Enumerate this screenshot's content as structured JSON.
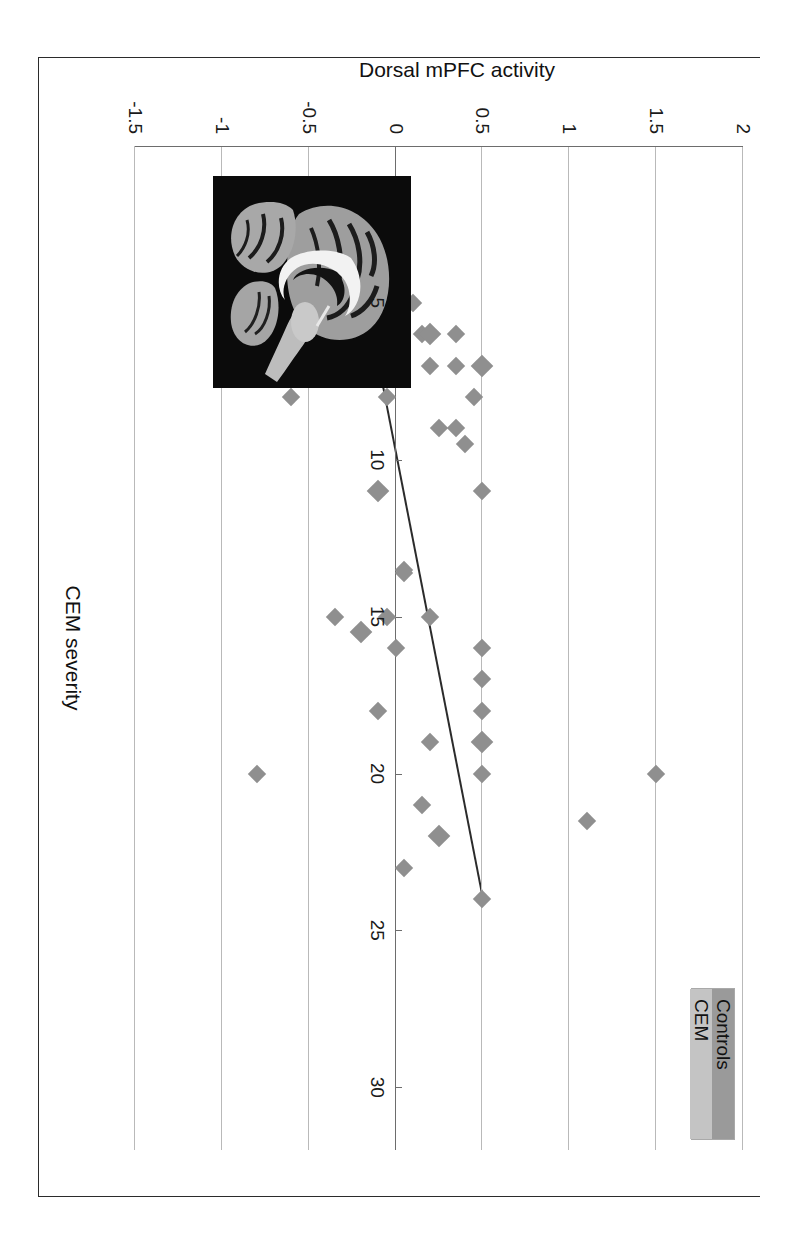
{
  "figure": {
    "legend": {
      "items": [
        {
          "label": "Controls",
          "color": "#9a9a9a"
        },
        {
          "label": "CEM",
          "color": "#c4c4c4"
        }
      ]
    },
    "inset": {
      "name": "sagittal-brain-mri",
      "description": "Sagittal MRI brain slice showing dorsal mPFC region"
    },
    "orientation_note": "Chart printed rotated 90 degrees clockwise on the page"
  },
  "chart_data": {
    "type": "scatter",
    "title": "",
    "xlabel": "CEM severity",
    "ylabel": "Dorsal mPFC activity",
    "xlim": [
      0,
      32
    ],
    "ylim": [
      -1.5,
      2
    ],
    "xticks": [
      5,
      10,
      15,
      20,
      25,
      30
    ],
    "yticks": [
      -1.5,
      -1,
      -0.5,
      0,
      0.5,
      1,
      1.5,
      2
    ],
    "grid": true,
    "legend_position": "top-right",
    "marker": "diamond",
    "marker_color": "#8f8f8f",
    "trendline": {
      "name": "linear-fit",
      "color": "#2b2b2b",
      "x_start": 4.6,
      "y_start": -0.18,
      "x_end": 23.9,
      "y_end": 0.5
    },
    "points": [
      {
        "x": 5,
        "y": -0.9
      },
      {
        "x": 5,
        "y": -0.35
      },
      {
        "x": 5,
        "y": -0.3
      },
      {
        "x": 5,
        "y": -0.05
      },
      {
        "x": 5,
        "y": 0.1
      },
      {
        "x": 6,
        "y": -0.05
      },
      {
        "x": 6,
        "y": 0.15
      },
      {
        "x": 6,
        "y": 0.2
      },
      {
        "x": 6,
        "y": 0.35
      },
      {
        "x": 7,
        "y": -0.8
      },
      {
        "x": 7,
        "y": -0.3
      },
      {
        "x": 7,
        "y": -0.05
      },
      {
        "x": 7,
        "y": 0.2
      },
      {
        "x": 7,
        "y": 0.35
      },
      {
        "x": 7,
        "y": 0.5
      },
      {
        "x": 8,
        "y": -0.6
      },
      {
        "x": 8,
        "y": -0.05
      },
      {
        "x": 8,
        "y": 0.45
      },
      {
        "x": 9,
        "y": 0.25
      },
      {
        "x": 9,
        "y": 0.35
      },
      {
        "x": 9.5,
        "y": 0.4
      },
      {
        "x": 11,
        "y": -0.1
      },
      {
        "x": 11,
        "y": 0.5
      },
      {
        "x": 13.5,
        "y": 0.05
      },
      {
        "x": 13.6,
        "y": 0.05
      },
      {
        "x": 15,
        "y": -0.05
      },
      {
        "x": 15,
        "y": 0.2
      },
      {
        "x": 15,
        "y": -0.35
      },
      {
        "x": 15.5,
        "y": -0.2
      },
      {
        "x": 16,
        "y": 0.0
      },
      {
        "x": 16,
        "y": 0.5
      },
      {
        "x": 17,
        "y": 0.5
      },
      {
        "x": 18,
        "y": 0.5
      },
      {
        "x": 18,
        "y": -0.1
      },
      {
        "x": 19,
        "y": 0.5
      },
      {
        "x": 19,
        "y": 0.5
      },
      {
        "x": 19,
        "y": 0.2
      },
      {
        "x": 20,
        "y": 1.5
      },
      {
        "x": 20,
        "y": 0.5
      },
      {
        "x": 20,
        "y": -0.8
      },
      {
        "x": 21,
        "y": 0.15
      },
      {
        "x": 21.5,
        "y": 1.1
      },
      {
        "x": 22,
        "y": 0.25
      },
      {
        "x": 23,
        "y": 0.05
      },
      {
        "x": 24,
        "y": 0.5
      }
    ]
  }
}
